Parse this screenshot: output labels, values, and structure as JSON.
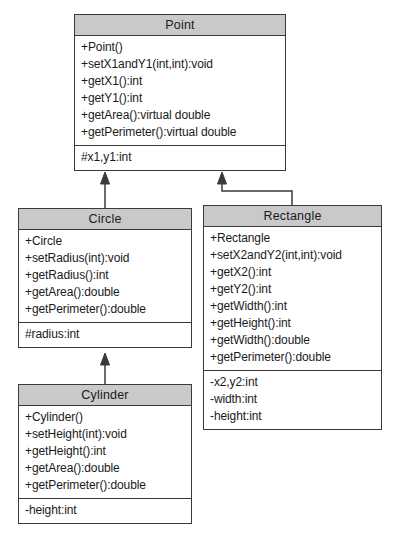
{
  "diagram": {
    "colors": {
      "header_fill": "#c9c9c9",
      "border": "#3a3a3a",
      "body_fill": "#ffffff",
      "text": "#1a1a1a"
    }
  },
  "classes": {
    "point": {
      "name": "Point",
      "methods": [
        "+Point()",
        "+setX1andY1(int,int):void",
        "+getX1():int",
        "+getY1():int",
        "+getArea():virtual double",
        "+getPerimeter():virtual double"
      ],
      "attributes": [
        "#x1,y1:int"
      ]
    },
    "circle": {
      "name": "Circle",
      "methods": [
        "+Circle",
        "+setRadius(int):void",
        "+getRadius():int",
        "+getArea():double",
        "+getPerimeter():double"
      ],
      "attributes": [
        "#radius:int"
      ]
    },
    "cylinder": {
      "name": "Cylinder",
      "methods": [
        "+Cylinder()",
        "+setHeight(int):void",
        "+getHeight():int",
        "+getArea():double",
        "+getPerimeter():double"
      ],
      "attributes": [
        "-height:int"
      ]
    },
    "rectangle": {
      "name": "Rectangle",
      "methods": [
        "+Rectangle",
        "+setX2andY2(int,int):void",
        "+getX2():int",
        "+getY2():int",
        "+getWidth():int",
        "+getHeight():int",
        "+getWidth():double",
        "+getPerimeter():double"
      ],
      "attributes": [
        "-x2,y2:int",
        "-width:int",
        "-height:int"
      ]
    }
  },
  "relationships": [
    {
      "type": "generalization",
      "from": "Circle",
      "to": "Point"
    },
    {
      "type": "generalization",
      "from": "Rectangle",
      "to": "Point"
    },
    {
      "type": "generalization",
      "from": "Cylinder",
      "to": "Circle"
    }
  ]
}
